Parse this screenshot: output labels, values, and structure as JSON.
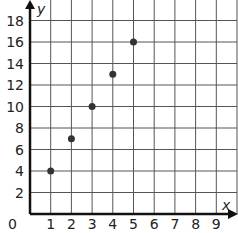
{
  "chart_data": {
    "type": "scatter",
    "title": "",
    "xlabel": "x",
    "ylabel": "y",
    "xlim": [
      0,
      9
    ],
    "ylim": [
      0,
      18
    ],
    "x_ticks": [
      "1",
      "2",
      "3",
      "4",
      "5",
      "6",
      "7",
      "8",
      "9"
    ],
    "y_ticks": [
      "2",
      "4",
      "6",
      "8",
      "10",
      "12",
      "14",
      "16",
      "18"
    ],
    "origin_label": "0",
    "grid": true,
    "x_step": 1,
    "y_step": 2,
    "points": [
      {
        "x": 1,
        "y": 4
      },
      {
        "x": 2,
        "y": 7
      },
      {
        "x": 3,
        "y": 10
      },
      {
        "x": 4,
        "y": 13
      },
      {
        "x": 5,
        "y": 16
      }
    ]
  },
  "colors": {
    "grid": "#555555",
    "axis": "#111111",
    "point": "#333333"
  }
}
